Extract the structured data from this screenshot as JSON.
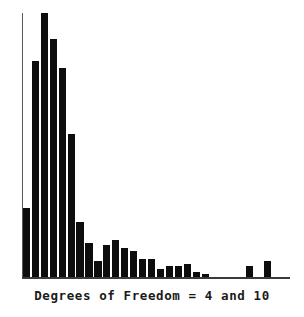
{
  "figure": {
    "caption": "Degrees of Freedom = 4 and 10",
    "background_color": "#ffffff",
    "bar_color": "#0d0d0d",
    "axis_color": "#3a3a3a"
  },
  "chart_data": {
    "type": "bar",
    "title": "",
    "subtitle": "",
    "xlabel": "Degrees of Freedom = 4 and 10",
    "ylabel": "",
    "grid": false,
    "legend": null,
    "axis": {
      "x_line": true,
      "y_line": true,
      "x_ticks": [],
      "y_ticks": [],
      "xlim": [
        0,
        30
      ],
      "ylim": [
        0,
        100
      ]
    },
    "note": "Monte-Carlo sampling distribution of the F statistic with 4 and 10 degrees of freedom; values are relative bin frequencies (percent of the tallest bin) read off the bar heights.",
    "categories": [
      "bin1",
      "bin2",
      "bin3",
      "bin4",
      "bin5",
      "bin6",
      "bin7",
      "bin8",
      "bin9",
      "bin10",
      "bin11",
      "bin12",
      "bin13",
      "bin14",
      "bin15",
      "bin16",
      "bin17",
      "bin18",
      "bin19",
      "bin20",
      "bin21",
      "bin22",
      "bin23",
      "bin24",
      "bin25",
      "bin26",
      "bin27",
      "bin28",
      "bin29",
      "bin30"
    ],
    "values": [
      26,
      82,
      100,
      90,
      79,
      54,
      21,
      13,
      6,
      12,
      14,
      11,
      10,
      7,
      7,
      3,
      4,
      4,
      5,
      2,
      1,
      0,
      0,
      0,
      0,
      4,
      0,
      6,
      0,
      0
    ]
  }
}
